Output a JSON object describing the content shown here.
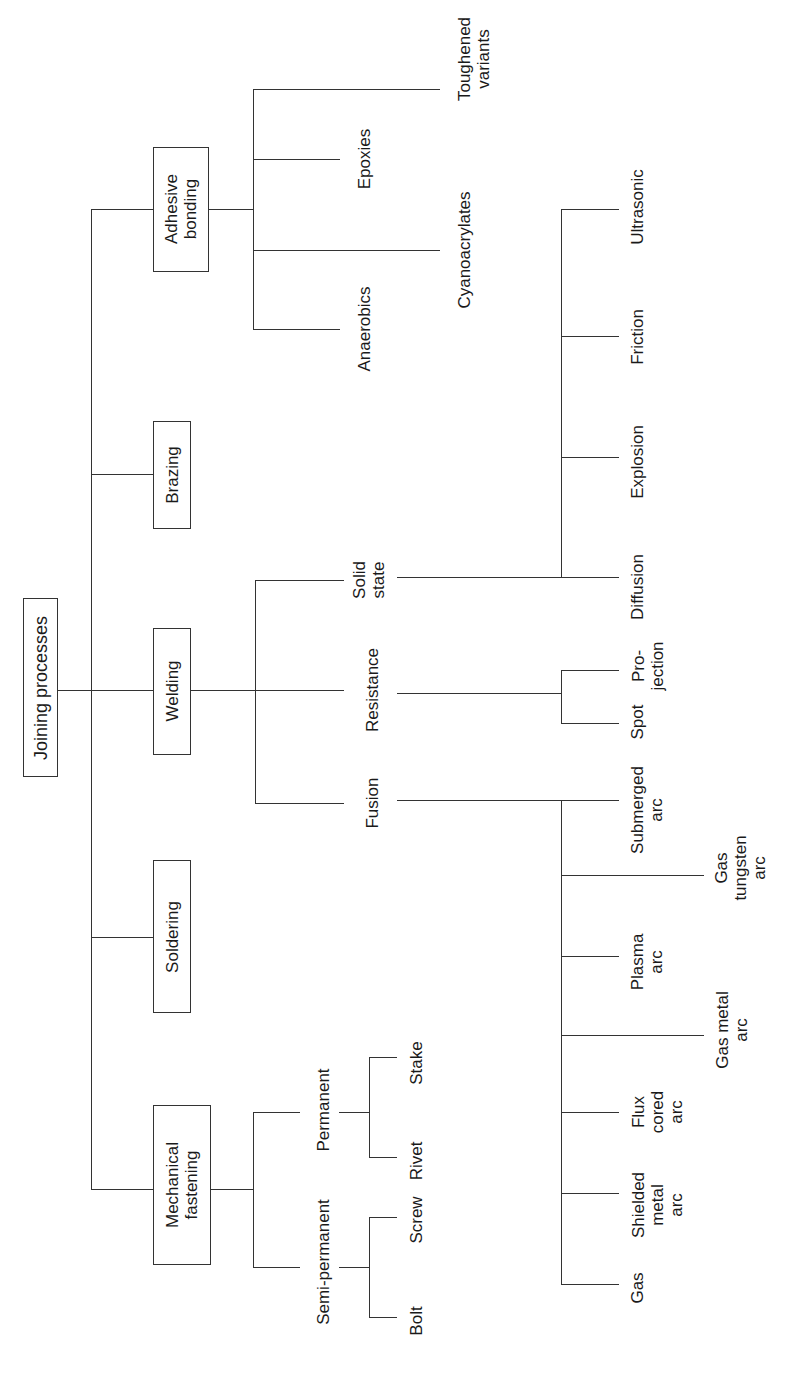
{
  "diagram": {
    "type": "tree",
    "orientation": "rotated-90-ccw",
    "root": "Joining processes",
    "categories": {
      "adhesive": {
        "label": "Adhesive\nbonding",
        "children": [
          "Anaerobics",
          "Cyanoacrylates",
          "Epoxies",
          "Toughened\nvariants"
        ]
      },
      "brazing": {
        "label": "Brazing"
      },
      "welding": {
        "label": "Welding",
        "fusion": {
          "label": "Fusion",
          "children": [
            "Gas",
            "Shielded\nmetal\narc",
            "Flux\ncored\narc",
            "Gas metal\narc",
            "Plasma\narc",
            "Gas\ntungsten\narc",
            "Submerged\narc"
          ]
        },
        "resistance": {
          "label": "Resistance",
          "children": [
            "Spot",
            "Pro-\njection"
          ]
        },
        "solid_state": {
          "label": "Solid\nstate",
          "children": [
            "Diffusion",
            "Explosion",
            "Friction",
            "Ultrasonic"
          ]
        }
      },
      "soldering": {
        "label": "Soldering"
      },
      "mechanical": {
        "label": "Mechanical\nfastening",
        "semi_permanent": {
          "label": "Semi-permanent",
          "children": [
            "Bolt",
            "Screw"
          ]
        },
        "permanent": {
          "label": "Permanent",
          "children": [
            "Rivet",
            "Stake"
          ]
        }
      }
    }
  }
}
